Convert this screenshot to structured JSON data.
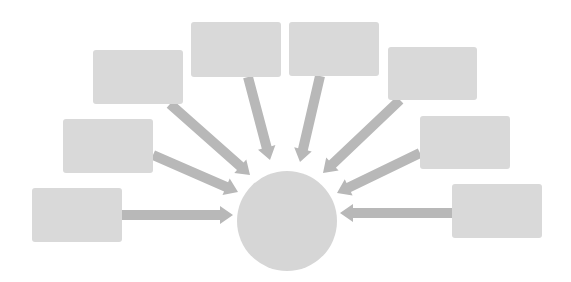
{
  "diagram": {
    "type": "hub-and-spoke",
    "colors": {
      "background": "#ffffff",
      "box_fill": "#d9d9d9",
      "hub_fill": "#d6d6d6",
      "arrow_fill": "#b8b8b8"
    },
    "hub": {
      "label": "",
      "cx": 287,
      "cy": 221,
      "r": 50
    },
    "boxes": [
      {
        "id": "box-1",
        "label": "",
        "x": 32,
        "y": 188,
        "w": 90,
        "h": 54
      },
      {
        "id": "box-2",
        "label": "",
        "x": 63,
        "y": 119,
        "w": 90,
        "h": 54
      },
      {
        "id": "box-3",
        "label": "",
        "x": 93,
        "y": 50,
        "w": 90,
        "h": 54
      },
      {
        "id": "box-4",
        "label": "",
        "x": 191,
        "y": 22,
        "w": 90,
        "h": 55
      },
      {
        "id": "box-5",
        "label": "",
        "x": 289,
        "y": 22,
        "w": 90,
        "h": 54
      },
      {
        "id": "box-6",
        "label": "",
        "x": 388,
        "y": 47,
        "w": 89,
        "h": 53
      },
      {
        "id": "box-7",
        "label": "",
        "x": 420,
        "y": 116,
        "w": 90,
        "h": 53
      },
      {
        "id": "box-8",
        "label": "",
        "x": 452,
        "y": 184,
        "w": 90,
        "h": 54
      }
    ],
    "arrows": [
      {
        "from": "box-1",
        "to": "hub",
        "x1": 122,
        "y1": 215,
        "x2": 233,
        "y2": 215
      },
      {
        "from": "box-2",
        "to": "hub",
        "x1": 153,
        "y1": 155,
        "x2": 238,
        "y2": 192
      },
      {
        "from": "box-3",
        "to": "hub",
        "x1": 170,
        "y1": 104,
        "x2": 250,
        "y2": 175
      },
      {
        "from": "box-4",
        "to": "hub",
        "x1": 248,
        "y1": 77,
        "x2": 270,
        "y2": 160
      },
      {
        "from": "box-5",
        "to": "hub",
        "x1": 320,
        "y1": 76,
        "x2": 300,
        "y2": 162
      },
      {
        "from": "box-6",
        "to": "hub",
        "x1": 400,
        "y1": 100,
        "x2": 323,
        "y2": 173
      },
      {
        "from": "box-7",
        "to": "hub",
        "x1": 420,
        "y1": 153,
        "x2": 337,
        "y2": 193
      },
      {
        "from": "box-8",
        "to": "hub",
        "x1": 452,
        "y1": 213,
        "x2": 340,
        "y2": 213
      }
    ]
  }
}
